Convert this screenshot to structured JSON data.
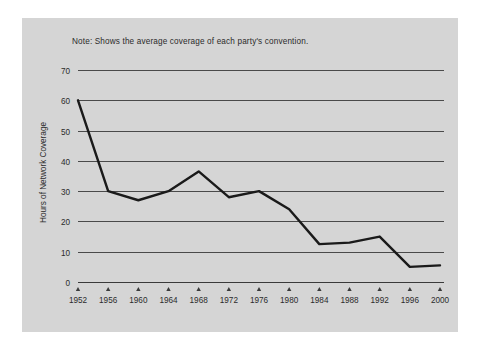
{
  "figure": {
    "note": "Note: Shows the average coverage of each party's convention.",
    "panel_color": "#d5d5d5",
    "line_color": "#1a1a1a",
    "grid_color": "#4a4a4a"
  },
  "chart_data": {
    "type": "line",
    "title": "",
    "subtitle": "",
    "note": "Note: Shows the average coverage of each party's convention.",
    "xlabel": "",
    "ylabel": "Hours of Network Coverage",
    "x": [
      1952,
      1956,
      1960,
      1964,
      1968,
      1972,
      1976,
      1980,
      1984,
      1988,
      1992,
      1996,
      2000
    ],
    "categories": [
      "1952",
      "1956",
      "1960",
      "1964",
      "1968",
      "1972",
      "1976",
      "1980",
      "1984",
      "1988",
      "1992",
      "1996",
      "2000"
    ],
    "values": [
      60,
      30,
      27,
      30,
      36.5,
      28,
      30,
      24,
      12.5,
      13,
      15,
      5,
      5.5
    ],
    "series": [
      {
        "name": "Hours of Network Coverage",
        "values": [
          60,
          30,
          27,
          30,
          36.5,
          28,
          30,
          24,
          12.5,
          13,
          15,
          5,
          5.5
        ]
      }
    ],
    "ylim": [
      0,
      70
    ],
    "xlim": [
      1952,
      2000
    ],
    "yticks": [
      0,
      10,
      20,
      30,
      40,
      50,
      60,
      70
    ],
    "ytick_labels": [
      "0",
      "10",
      "20",
      "30",
      "40",
      "50",
      "60",
      "70"
    ],
    "xticks": [
      1952,
      1956,
      1960,
      1964,
      1968,
      1972,
      1976,
      1980,
      1984,
      1988,
      1992,
      1996,
      2000
    ],
    "xtick_labels": [
      "1952",
      "1956",
      "1960",
      "1964",
      "1968",
      "1972",
      "1976",
      "1980",
      "1984",
      "1988",
      "1992",
      "1996",
      "2000"
    ],
    "grid": "horizontal",
    "legend": "none"
  }
}
